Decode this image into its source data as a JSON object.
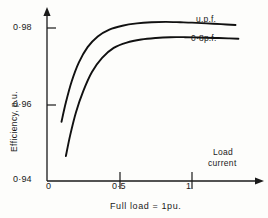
{
  "chart_data": {
    "type": "line",
    "title": "",
    "subtitle": "",
    "xlabel": "Load current",
    "ylabel": "Efficiency,  p.u.",
    "caption": "Full load = 1pu.",
    "grid": false,
    "legend_position": "inline-right",
    "xlim": [
      0,
      1.35
    ],
    "ylim": [
      0.94,
      0.988
    ],
    "x_ticks": [
      {
        "value": 0,
        "label": "0"
      },
      {
        "value": 0.5,
        "label": "0·5"
      },
      {
        "value": 1,
        "label": "1"
      }
    ],
    "y_ticks": [
      {
        "value": 0.94,
        "label": "0·94"
      },
      {
        "value": 0.96,
        "label": "0·96"
      },
      {
        "value": 0.98,
        "label": "0·98"
      }
    ],
    "series": [
      {
        "name": "u.p.f.",
        "label": "u.p.f.",
        "color": "#111111",
        "x": [
          0.1,
          0.13,
          0.17,
          0.22,
          0.28,
          0.35,
          0.43,
          0.52,
          0.62,
          0.72,
          0.82,
          0.92,
          1.0,
          1.1,
          1.2,
          1.3
        ],
        "values": [
          0.9555,
          0.9605,
          0.966,
          0.971,
          0.975,
          0.9778,
          0.9796,
          0.9806,
          0.9812,
          0.9815,
          0.9816,
          0.9815,
          0.9814,
          0.9812,
          0.981,
          0.9808
        ]
      },
      {
        "name": "0·8 p.f.",
        "label": "0·8p.f.",
        "color": "#111111",
        "x": [
          0.13,
          0.16,
          0.2,
          0.25,
          0.31,
          0.38,
          0.46,
          0.55,
          0.65,
          0.75,
          0.85,
          0.95,
          1.05,
          1.15,
          1.25,
          1.32
        ],
        "values": [
          0.9465,
          0.952,
          0.958,
          0.9635,
          0.9685,
          0.9722,
          0.9748,
          0.9762,
          0.977,
          0.9774,
          0.9776,
          0.9776,
          0.9775,
          0.9774,
          0.9773,
          0.9772
        ]
      }
    ]
  },
  "axes": {
    "y_title": "Efficiency,  p.u.",
    "x_title_line1": "Load",
    "x_title_line2": "current"
  },
  "footer": {
    "caption": "Full load = 1pu."
  }
}
